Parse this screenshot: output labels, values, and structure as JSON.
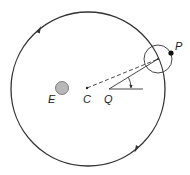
{
  "diagram": {
    "type": "epicycle-deferent",
    "labels": {
      "earth": "E",
      "center": "C",
      "equant": "Q",
      "planet": "P"
    },
    "colors": {
      "stroke": "#333333",
      "earth_fill": "#b8b8b8",
      "planet_fill": "#111111"
    },
    "elements": [
      "deferent circle",
      "epicycle circle",
      "earth disk",
      "planet dot",
      "dashed line C to epicycle center",
      "solid line Q to epicycle center",
      "horizontal reference line from Q",
      "angle arc with arrow",
      "direction arrows on deferent"
    ]
  }
}
